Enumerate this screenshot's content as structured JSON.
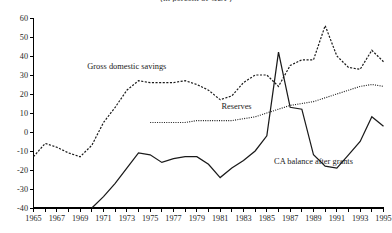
{
  "chart_data": {
    "type": "line",
    "title": "(in percent of GDP)",
    "title_clipped": true,
    "xlabel": "",
    "ylabel": "",
    "xlim": [
      1965,
      1995
    ],
    "ylim": [
      -40,
      60
    ],
    "yticks": [
      -40,
      -30,
      -20,
      -10,
      0,
      10,
      20,
      30,
      40,
      50,
      60
    ],
    "xticks": [
      1965,
      1966,
      1967,
      1968,
      1969,
      1970,
      1971,
      1972,
      1973,
      1974,
      1975,
      1976,
      1977,
      1978,
      1979,
      1980,
      1981,
      1982,
      1983,
      1984,
      1985,
      1986,
      1987,
      1988,
      1989,
      1990,
      1991,
      1992,
      1993,
      1994,
      1995
    ],
    "xticklabels": [
      "1965",
      "1967",
      "1969",
      "1971",
      "1973",
      "1975",
      "1977",
      "1979",
      "1981",
      "1983",
      "1985",
      "1987",
      "1989",
      "1991",
      "1993",
      "1995"
    ],
    "xticklabel_step": 2,
    "grid": false,
    "legend_position": "inline-annotations",
    "series": [
      {
        "name": "Gross domestic savings",
        "style": "dashed",
        "color": "#1a1a1a",
        "x": [
          1965,
          1966,
          1967,
          1968,
          1969,
          1970,
          1971,
          1972,
          1973,
          1974,
          1975,
          1976,
          1977,
          1978,
          1979,
          1980,
          1981,
          1982,
          1983,
          1984,
          1985,
          1986,
          1987,
          1988,
          1989,
          1990,
          1991,
          1992,
          1993,
          1994,
          1995
        ],
        "values": [
          -13,
          -6,
          -8,
          -11,
          -13,
          -7,
          5,
          13,
          22,
          27,
          26,
          26,
          26,
          27,
          25,
          22,
          17,
          19,
          26,
          30,
          30,
          24,
          35,
          38,
          38,
          56,
          40,
          34,
          33,
          43,
          37
        ]
      },
      {
        "name": "Reserves",
        "style": "dotted",
        "color": "#1a1a1a",
        "x": [
          1975,
          1976,
          1977,
          1978,
          1979,
          1980,
          1981,
          1982,
          1983,
          1984,
          1985,
          1986,
          1987,
          1988,
          1989,
          1990,
          1991,
          1992,
          1993,
          1994,
          1995
        ],
        "values": [
          5,
          5,
          5,
          5,
          6,
          6,
          6,
          6,
          7,
          8,
          10,
          12,
          14,
          15,
          16,
          18,
          20,
          22,
          24,
          25,
          24
        ]
      },
      {
        "name": "CA balance after grants",
        "style": "solid",
        "color": "#1a1a1a",
        "x": [
          1970,
          1971,
          1972,
          1973,
          1974,
          1975,
          1976,
          1977,
          1978,
          1979,
          1980,
          1981,
          1982,
          1983,
          1984,
          1985,
          1986,
          1987,
          1988,
          1989,
          1990,
          1991,
          1992,
          1993,
          1994,
          1995
        ],
        "values": [
          -40,
          -34,
          -27,
          -19,
          -11,
          -12,
          -16,
          -14,
          -13,
          -13,
          -17,
          -24,
          -19,
          -15,
          -10,
          -2,
          42,
          13,
          12,
          -12,
          -18,
          -19,
          -12,
          -5,
          8,
          3
        ]
      }
    ],
    "annotations": [
      {
        "text": "Gross domestic savings",
        "x": 1973.0,
        "y": 33,
        "anchor": "middle"
      },
      {
        "text": "Reserves",
        "x": 1982.4,
        "y": 12,
        "anchor": "middle"
      },
      {
        "text": "CA balance after grants",
        "x": 1989.0,
        "y": -17,
        "anchor": "middle"
      }
    ]
  }
}
